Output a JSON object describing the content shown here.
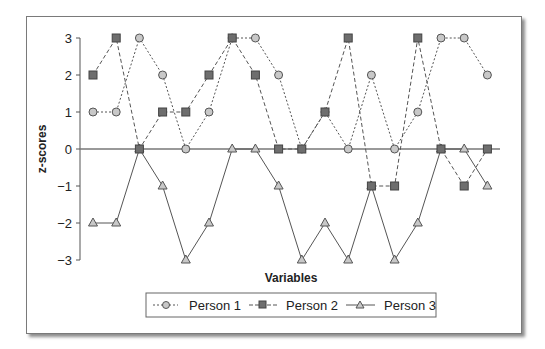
{
  "chart_data": {
    "type": "line",
    "title": "",
    "xlabel": "Variables",
    "ylabel": "z-scores",
    "ylim": [
      -3,
      3
    ],
    "yticks": [
      3,
      2,
      1,
      0,
      -1,
      -2,
      -3
    ],
    "ytick_labels": [
      "3",
      "2",
      "1",
      "0",
      "−1",
      "−2",
      "−3"
    ],
    "x": [
      1,
      2,
      3,
      4,
      5,
      6,
      7,
      8,
      9,
      10,
      11,
      12,
      13,
      14,
      15,
      16,
      17,
      18
    ],
    "xtick_labels_shown": false,
    "grid": false,
    "zero_line": true,
    "legend_position": "bottom",
    "series": [
      {
        "name": "Person 1",
        "marker": "circle",
        "line": "dotted",
        "values": [
          1,
          1,
          3,
          2,
          0,
          1,
          3,
          3,
          2,
          0,
          1,
          0,
          2,
          0,
          1,
          3,
          3,
          2
        ]
      },
      {
        "name": "Person 2",
        "marker": "square",
        "line": "dashed",
        "values": [
          2,
          3,
          0,
          1,
          1,
          2,
          3,
          2,
          0,
          0,
          1,
          3,
          -1,
          -1,
          3,
          0,
          -1,
          0
        ]
      },
      {
        "name": "Person 3",
        "marker": "triangle",
        "line": "solid",
        "values": [
          -2,
          -2,
          0,
          -1,
          -3,
          -2,
          0,
          0,
          -1,
          -3,
          -2,
          -3,
          -1,
          -3,
          -2,
          0,
          0,
          -1
        ]
      }
    ]
  },
  "legend": {
    "person1": "Person 1",
    "person2": "Person 2",
    "person3": "Person 3"
  },
  "axes": {
    "xlabel": "Variables",
    "ylabel": "z-scores"
  },
  "colors": {
    "circle_fill": "#c8c8c8",
    "square_fill": "#6e6e6e",
    "triangle_fill": "#c8c8c8",
    "stroke": "#555555"
  }
}
